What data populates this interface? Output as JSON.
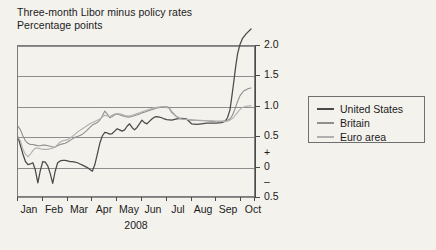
{
  "chart_data": {
    "type": "line",
    "title": "Three-month Libor minus policy rates",
    "subtitle": "Percentage points",
    "xlabel": "2008",
    "ylabel": "",
    "ylim": [
      -0.5,
      2.0
    ],
    "grid": true,
    "legend_position": "right",
    "y_ticks": [
      "2.0",
      "1.5",
      "1.0",
      "0.5",
      "0",
      "0.5"
    ],
    "y_sign_plus": "+",
    "y_sign_minus": "–",
    "x_ticks": [
      "Jan",
      "Feb",
      "Mar",
      "Apr",
      "May",
      "Jun",
      "Jul",
      "Aug",
      "Sep",
      "Oct"
    ],
    "note_clipped_series": "United States rises above the 2.0 axis maximum at the right edge",
    "series": [
      {
        "name": "United States",
        "color": "#4a4a4a",
        "x": [
          0.0,
          0.1,
          0.2,
          0.3,
          0.4,
          0.5,
          0.6,
          0.7,
          0.8,
          0.9,
          1.0,
          1.1,
          1.2,
          1.3,
          1.4,
          1.5,
          1.6,
          1.7,
          1.8,
          1.9,
          2.0,
          2.1,
          2.2,
          2.3,
          2.4,
          2.5,
          2.6,
          2.7,
          2.8,
          2.9,
          3.0,
          3.1,
          3.2,
          3.3,
          3.4,
          3.5,
          3.6,
          3.7,
          3.8,
          3.9,
          4.0,
          4.1,
          4.2,
          4.3,
          4.4,
          4.5,
          4.6,
          4.7,
          4.8,
          4.9,
          5.0,
          5.1,
          5.2,
          5.3,
          5.4,
          5.5,
          5.6,
          5.7,
          5.8,
          5.9,
          6.0,
          6.2,
          6.4,
          6.6,
          6.8,
          7.0,
          7.2,
          7.4,
          7.6,
          7.8,
          8.0,
          8.2,
          8.35,
          8.45,
          8.55,
          8.62,
          8.7,
          8.78,
          8.86,
          8.95,
          9.05,
          9.2,
          9.4
        ],
        "y": [
          0.5,
          0.36,
          0.22,
          0.1,
          0.05,
          0.06,
          0.08,
          -0.04,
          -0.25,
          -0.05,
          0.1,
          0.09,
          0.03,
          -0.1,
          -0.26,
          -0.06,
          0.08,
          0.11,
          0.12,
          0.12,
          0.11,
          0.1,
          0.1,
          0.09,
          0.08,
          0.06,
          0.04,
          0.02,
          0.0,
          -0.03,
          -0.06,
          0.05,
          0.22,
          0.4,
          0.52,
          0.58,
          0.57,
          0.55,
          0.56,
          0.6,
          0.64,
          0.62,
          0.6,
          0.62,
          0.68,
          0.72,
          0.66,
          0.62,
          0.66,
          0.72,
          0.78,
          0.74,
          0.72,
          0.76,
          0.8,
          0.83,
          0.84,
          0.83,
          0.82,
          0.8,
          0.79,
          0.78,
          0.8,
          0.81,
          0.8,
          0.72,
          0.71,
          0.72,
          0.73,
          0.73,
          0.73,
          0.74,
          0.76,
          0.82,
          0.95,
          1.15,
          1.4,
          1.66,
          1.88,
          2.02,
          2.12,
          2.2,
          2.28
        ]
      },
      {
        "name": "Britain",
        "color": "#8f8f8f",
        "x": [
          0.0,
          0.1,
          0.2,
          0.3,
          0.4,
          0.5,
          0.6,
          0.7,
          0.8,
          0.9,
          1.0,
          1.1,
          1.2,
          1.3,
          1.4,
          1.5,
          1.6,
          1.7,
          1.8,
          1.9,
          2.0,
          2.15,
          2.3,
          2.45,
          2.6,
          2.75,
          2.9,
          3.0,
          3.1,
          3.2,
          3.3,
          3.4,
          3.5,
          3.6,
          3.7,
          3.8,
          3.9,
          4.0,
          4.15,
          4.3,
          4.45,
          4.6,
          4.75,
          4.9,
          5.0,
          5.15,
          5.3,
          5.45,
          5.6,
          5.75,
          5.9,
          6.0,
          6.1,
          6.2,
          6.4,
          6.6,
          6.8,
          7.0,
          7.2,
          7.4,
          7.6,
          7.8,
          8.0,
          8.2,
          8.4,
          8.55,
          8.65,
          8.75,
          8.85,
          8.95,
          9.1,
          9.3,
          9.4
        ],
        "y": [
          0.68,
          0.62,
          0.52,
          0.44,
          0.4,
          0.38,
          0.38,
          0.37,
          0.36,
          0.36,
          0.37,
          0.37,
          0.36,
          0.35,
          0.34,
          0.34,
          0.36,
          0.38,
          0.39,
          0.4,
          0.42,
          0.46,
          0.5,
          0.52,
          0.55,
          0.6,
          0.66,
          0.7,
          0.72,
          0.74,
          0.78,
          0.85,
          0.93,
          0.88,
          0.82,
          0.84,
          0.87,
          0.88,
          0.86,
          0.84,
          0.83,
          0.84,
          0.86,
          0.88,
          0.9,
          0.92,
          0.94,
          0.96,
          0.98,
          0.99,
          1.0,
          1.0,
          0.99,
          0.92,
          0.84,
          0.8,
          0.79,
          0.78,
          0.78,
          0.77,
          0.77,
          0.76,
          0.76,
          0.76,
          0.77,
          0.8,
          0.86,
          0.96,
          1.08,
          1.18,
          1.26,
          1.3,
          1.31
        ]
      },
      {
        "name": "Euro area",
        "color": "#b0b0b0",
        "x": [
          0.0,
          0.1,
          0.2,
          0.3,
          0.4,
          0.5,
          0.6,
          0.7,
          0.8,
          0.9,
          1.0,
          1.1,
          1.2,
          1.3,
          1.4,
          1.5,
          1.6,
          1.7,
          1.8,
          1.9,
          2.0,
          2.15,
          2.3,
          2.45,
          2.6,
          2.75,
          2.9,
          3.0,
          3.1,
          3.2,
          3.3,
          3.4,
          3.5,
          3.6,
          3.7,
          3.8,
          3.9,
          4.0,
          4.15,
          4.3,
          4.45,
          4.6,
          4.75,
          4.9,
          5.0,
          5.15,
          5.3,
          5.45,
          5.6,
          5.75,
          5.9,
          6.0,
          6.1,
          6.2,
          6.4,
          6.6,
          6.8,
          7.0,
          7.2,
          7.4,
          7.6,
          7.8,
          8.0,
          8.2,
          8.4,
          8.55,
          8.68,
          8.8,
          8.92,
          9.05,
          9.2,
          9.4
        ],
        "y": [
          0.5,
          0.44,
          0.3,
          0.22,
          0.18,
          0.22,
          0.28,
          0.32,
          0.32,
          0.31,
          0.3,
          0.3,
          0.3,
          0.31,
          0.32,
          0.34,
          0.38,
          0.42,
          0.44,
          0.45,
          0.46,
          0.5,
          0.55,
          0.6,
          0.64,
          0.68,
          0.72,
          0.74,
          0.76,
          0.78,
          0.8,
          0.83,
          0.86,
          0.85,
          0.84,
          0.86,
          0.88,
          0.89,
          0.88,
          0.86,
          0.85,
          0.86,
          0.88,
          0.9,
          0.92,
          0.94,
          0.96,
          0.98,
          0.99,
          1.0,
          1.0,
          0.99,
          0.97,
          0.9,
          0.83,
          0.8,
          0.79,
          0.79,
          0.78,
          0.78,
          0.77,
          0.77,
          0.76,
          0.76,
          0.76,
          0.78,
          0.82,
          0.88,
          0.94,
          0.99,
          1.01,
          1.02
        ]
      }
    ]
  },
  "legend": {
    "items": [
      {
        "label": "United States"
      },
      {
        "label": "Britain"
      },
      {
        "label": "Euro area"
      }
    ]
  }
}
